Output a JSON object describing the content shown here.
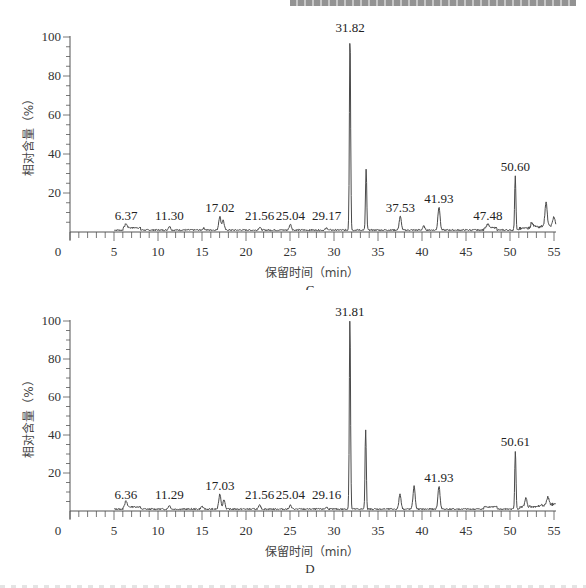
{
  "page": {
    "header_text_cropped": ""
  },
  "chart_data": [
    {
      "type": "line",
      "panel": "C",
      "title": "",
      "xlabel": "保留时间（min）",
      "ylabel": "相对含量（%）",
      "xlim": [
        0,
        55
      ],
      "ylim": [
        0,
        100
      ],
      "x_ticks": [
        0,
        5,
        10,
        15,
        20,
        25,
        30,
        35,
        40,
        45,
        50,
        55
      ],
      "y_ticks": [
        20,
        40,
        60,
        80,
        100
      ],
      "grid": false,
      "peaks": [
        {
          "rt": 6.37,
          "height": 2,
          "label": "6.37"
        },
        {
          "rt": 11.3,
          "height": 2,
          "label": "11.30"
        },
        {
          "rt": 15.2,
          "height": 1,
          "label": ""
        },
        {
          "rt": 17.02,
          "height": 7,
          "label": "17.02"
        },
        {
          "rt": 17.4,
          "height": 5,
          "label": ""
        },
        {
          "rt": 21.56,
          "height": 1.5,
          "label": "21.56"
        },
        {
          "rt": 25.04,
          "height": 3,
          "label": "25.04"
        },
        {
          "rt": 29.17,
          "height": 1,
          "label": "29.17"
        },
        {
          "rt": 31.82,
          "height": 100,
          "label": "31.82"
        },
        {
          "rt": 33.65,
          "height": 31,
          "label": ""
        },
        {
          "rt": 37.53,
          "height": 7,
          "label": "37.53"
        },
        {
          "rt": 40.2,
          "height": 2,
          "label": ""
        },
        {
          "rt": 41.93,
          "height": 12,
          "label": "41.93"
        },
        {
          "rt": 47.48,
          "height": 2,
          "label": "47.48"
        },
        {
          "rt": 50.6,
          "height": 28,
          "label": "50.60"
        },
        {
          "rt": 52.5,
          "height": 3,
          "label": ""
        },
        {
          "rt": 54.1,
          "height": 12,
          "label": ""
        },
        {
          "rt": 55.0,
          "height": 4,
          "label": ""
        }
      ]
    },
    {
      "type": "line",
      "panel": "D",
      "title": "",
      "xlabel": "保留时间（min）",
      "ylabel": "相对含量（%）",
      "xlim": [
        0,
        55
      ],
      "ylim": [
        0,
        100
      ],
      "x_ticks": [
        0,
        5,
        10,
        15,
        20,
        25,
        30,
        35,
        40,
        45,
        50,
        55
      ],
      "y_ticks": [
        20,
        40,
        60,
        80,
        100
      ],
      "grid": false,
      "peaks": [
        {
          "rt": 6.36,
          "height": 3,
          "label": "6.36"
        },
        {
          "rt": 11.29,
          "height": 2,
          "label": "11.29"
        },
        {
          "rt": 15.0,
          "height": 1.5,
          "label": ""
        },
        {
          "rt": 17.03,
          "height": 8,
          "label": "17.03"
        },
        {
          "rt": 17.5,
          "height": 5,
          "label": ""
        },
        {
          "rt": 21.56,
          "height": 2,
          "label": "21.56"
        },
        {
          "rt": 25.04,
          "height": 2,
          "label": "25.04"
        },
        {
          "rt": 29.16,
          "height": 1,
          "label": "29.16"
        },
        {
          "rt": 31.81,
          "height": 100,
          "label": "31.81"
        },
        {
          "rt": 33.6,
          "height": 42,
          "label": ""
        },
        {
          "rt": 37.5,
          "height": 8,
          "label": ""
        },
        {
          "rt": 39.1,
          "height": 12,
          "label": ""
        },
        {
          "rt": 41.93,
          "height": 12,
          "label": "41.93"
        },
        {
          "rt": 50.61,
          "height": 31,
          "label": "50.61"
        },
        {
          "rt": 51.8,
          "height": 5,
          "label": ""
        },
        {
          "rt": 54.3,
          "height": 4,
          "label": ""
        }
      ]
    }
  ],
  "panels": {
    "C": {
      "xlabel": "保留时间（min）",
      "ylabel": "相对含量（%）",
      "tag": "C"
    },
    "D": {
      "xlabel": "保留时间（min）",
      "ylabel": "相对含量（%）",
      "tag": "D"
    }
  },
  "colors": {
    "trace": "#4a4a4a",
    "axis": "#555555",
    "text": "#222222"
  }
}
